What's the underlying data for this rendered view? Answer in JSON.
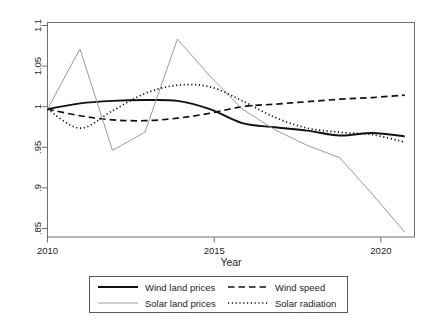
{
  "chart_data": {
    "type": "line",
    "title": "",
    "xlabel": "Year",
    "ylabel": "",
    "xlim": [
      2010,
      2021.3
    ],
    "ylim": [
      0.845,
      1.105
    ],
    "grid": false,
    "legend_position": "bottom",
    "x_ticks": [
      "2010",
      "2015",
      "2020"
    ],
    "x_tick_values": [
      2010,
      2015,
      2020
    ],
    "y_ticks": [
      ".85",
      ".9",
      ".95",
      "1",
      "1.05",
      "1.1"
    ],
    "y_tick_values": [
      0.85,
      0.9,
      0.95,
      1.0,
      1.05,
      1.1
    ],
    "x": [
      2010,
      2011,
      2012,
      2013,
      2014,
      2015,
      2016,
      2017,
      2018,
      2019,
      2020,
      2021
    ],
    "series": [
      {
        "name": "Wind land prices",
        "style": "solid",
        "color": "#111111",
        "width": 1.9,
        "values": [
          1.0,
          1.007,
          1.01,
          1.011,
          1.01,
          1.0,
          0.983,
          0.978,
          0.974,
          0.968,
          0.971,
          0.967
        ]
      },
      {
        "name": "Wind speed",
        "style": "dashed",
        "color": "#111111",
        "width": 1.7,
        "values": [
          1.0,
          0.992,
          0.987,
          0.986,
          0.989,
          0.995,
          1.003,
          1.006,
          1.009,
          1.012,
          1.014,
          1.017
        ]
      },
      {
        "name": "Solar land prices",
        "style": "solid",
        "color": "#9b9b9b",
        "width": 1.0,
        "values": [
          1.0,
          1.073,
          0.95,
          0.972,
          1.085,
          1.04,
          1.0,
          0.975,
          0.956,
          0.941,
          0.897,
          0.851
        ]
      },
      {
        "name": "Solar radiation",
        "style": "dotted",
        "color": "#111111",
        "width": 1.7,
        "values": [
          1.0,
          0.977,
          0.998,
          1.019,
          1.029,
          1.027,
          1.01,
          0.99,
          0.977,
          0.972,
          0.969,
          0.96
        ]
      }
    ]
  },
  "legend": {
    "entries": [
      {
        "label": "Wind land prices",
        "key": "solid-line-key"
      },
      {
        "label": "Wind speed",
        "key": "dashed-line-key"
      },
      {
        "label": "Solar land prices",
        "key": "thin-gray-line-key"
      },
      {
        "label": "Solar radiation",
        "key": "dotted-line-key"
      }
    ]
  }
}
